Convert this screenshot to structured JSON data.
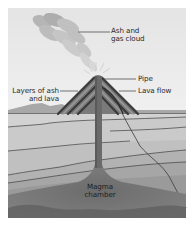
{
  "diagram": {
    "labels": {
      "ash_cloud": "Ash and\ngas cloud",
      "pipe": "Pipe",
      "layers": "Layers of ash\nand lava",
      "lava_flow": "Lava flow",
      "magma_chamber": "Magma\nchamber"
    },
    "colors": {
      "sky": "#ececec",
      "cloud": "#b4b4b4",
      "cone_dark": "#4a4a4a",
      "cone_light": "#8a8a8a",
      "pipe": "#6e6e6e",
      "strata_top": "#d6d6d6",
      "strata_bottom": "#7c7c7c",
      "magma": "#6a6a6a",
      "line": "#3a3a3a"
    }
  }
}
